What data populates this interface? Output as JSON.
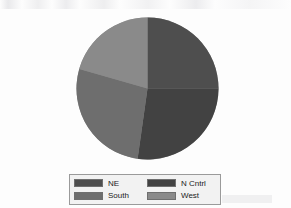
{
  "chart_data": {
    "type": "pie",
    "title": "",
    "subtitle": "",
    "xlabel": "",
    "ylabel": "",
    "grid": false,
    "legend_position": "bottom",
    "start_angle_deg": 0,
    "direction": "clockwise",
    "categories": [
      "NE",
      "N Cntrl",
      "South",
      "West"
    ],
    "values": [
      25,
      28,
      28,
      19
    ],
    "units": "percent",
    "slices": [
      {
        "label": "NE",
        "value": 25,
        "color": "#4e4e4e",
        "start_angle_deg": 0,
        "end_angle_deg": 90
      },
      {
        "label": "N Cntrl",
        "value": 28,
        "color": "#424242",
        "start_angle_deg": 90,
        "end_angle_deg": 188
      },
      {
        "label": "South",
        "value": 28,
        "color": "#6e6e6e",
        "start_angle_deg": 188,
        "end_angle_deg": 286
      },
      {
        "label": "West",
        "value": 19,
        "color": "#8a8a8a",
        "start_angle_deg": 286,
        "end_angle_deg": 360
      }
    ]
  },
  "legend": {
    "entries": [
      {
        "label": "NE",
        "color": "#4e4e4e"
      },
      {
        "label": "N Cntrl",
        "color": "#424242"
      },
      {
        "label": "South",
        "color": "#6e6e6e"
      },
      {
        "label": "West",
        "color": "#8a8a8a"
      }
    ],
    "border_color": "#9a9a9a",
    "background_color": "#f2f2f2"
  },
  "page": {
    "background_color": "#fdfdfd"
  }
}
